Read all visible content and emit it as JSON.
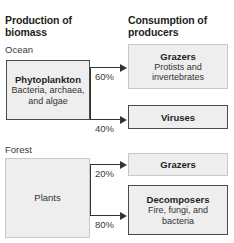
{
  "figure": {
    "columns": {
      "left_heading": "Production of biomass",
      "right_heading": "Consumption of producers"
    },
    "habitats": [
      {
        "name": "Ocean",
        "producer": {
          "title": "Phytoplankton",
          "subtitle": "Bacteria, archaea, and algae"
        },
        "flows": [
          {
            "percent": "60%",
            "target_title": "Grazers",
            "target_subtitle": "Protists and invertebrates"
          },
          {
            "percent": "40%",
            "target_title": "Viruses",
            "target_subtitle": ""
          }
        ]
      },
      {
        "name": "Forest",
        "producer": {
          "title": "Plants",
          "subtitle": ""
        },
        "flows": [
          {
            "percent": "20%",
            "target_title": "Grazers",
            "target_subtitle": ""
          },
          {
            "percent": "80%",
            "target_title": "Decomposers",
            "target_subtitle": "Fire, fungi, and bacteria"
          }
        ]
      }
    ],
    "colors": {
      "box_fill": "#eeeeee",
      "box_border_dark": "#4a4a4a",
      "box_border_light": "#c8c8c8",
      "arrow": "#333333",
      "text": "#231f20",
      "background": "#ffffff"
    }
  }
}
